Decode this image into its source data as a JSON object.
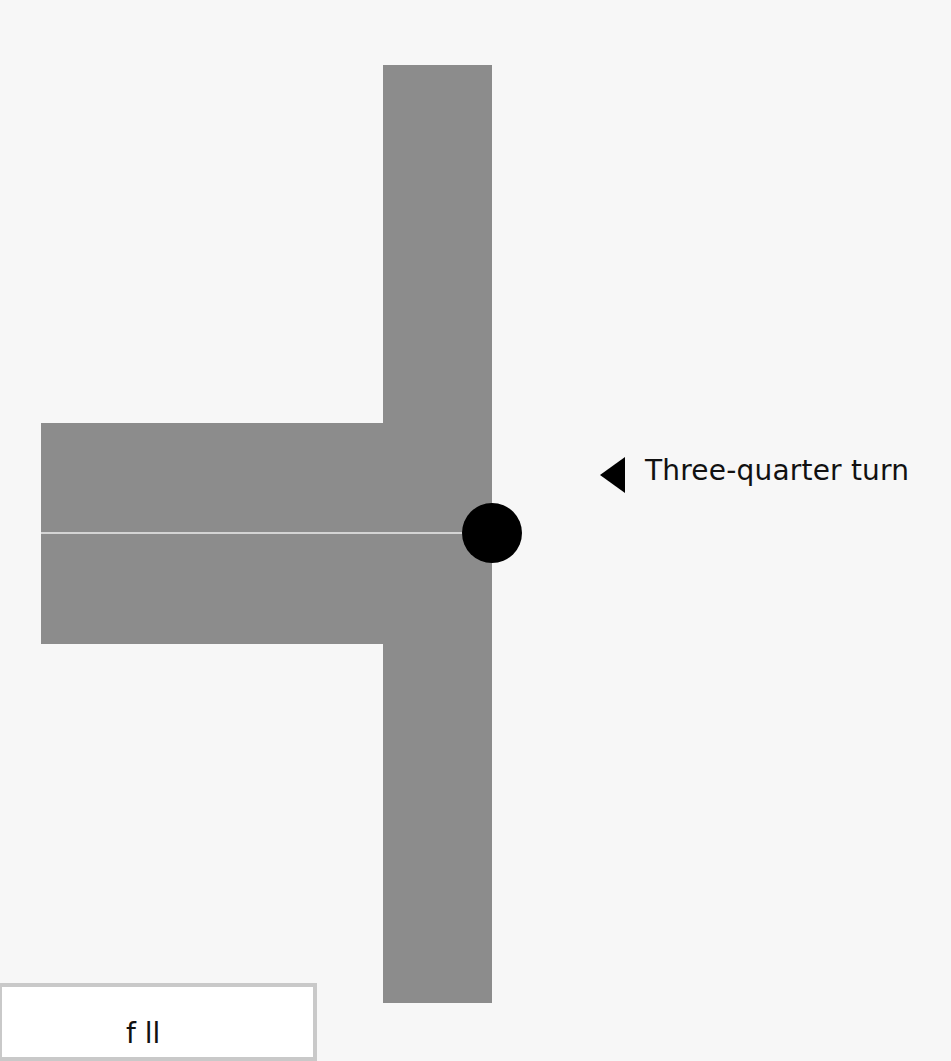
{
  "diagram": {
    "type": "junction-turn",
    "annotation": {
      "marker": "left-pointing-triangle",
      "label": "Three-quarter turn"
    },
    "pivot": "black-circle-marker",
    "bottom_box": {
      "text_partial": "f ll"
    },
    "colors": {
      "background": "#f7f7f7",
      "bar": "#8c8c8c",
      "divider": "#d4d4d4",
      "pivot": "#000000",
      "box_border": "#c9c9c9"
    }
  }
}
